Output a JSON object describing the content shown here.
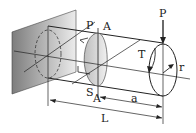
{
  "diagram": {
    "type": "mechanics",
    "labels": {
      "P_top": "P",
      "A_top": "A",
      "P_end": "P",
      "T": "T",
      "r": "r",
      "S": "S",
      "A_bottom": "A",
      "a": "a",
      "L": "L"
    },
    "colors": {
      "line": "#222222",
      "wall_dark": "#8a8a8a",
      "wall_light": "#e8e8e8",
      "section_fill": "#cfcfcf"
    }
  }
}
